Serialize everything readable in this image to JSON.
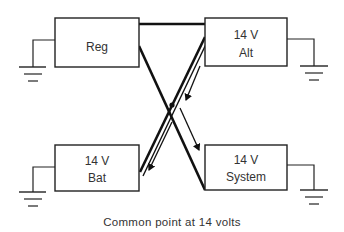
{
  "diagram": {
    "boxes": {
      "reg": {
        "line1": "Reg",
        "line2": ""
      },
      "alt": {
        "line1": "14 V",
        "line2": "Alt"
      },
      "bat": {
        "line1": "14 V",
        "line2": "Bat"
      },
      "system": {
        "line1": "14 V",
        "line2": "System"
      }
    },
    "caption": "Common point at 14 volts",
    "connections": [
      {
        "from": "Reg",
        "to": "Alt"
      },
      {
        "from": "Reg",
        "to": "System"
      },
      {
        "from": "Alt",
        "to": "Bat"
      }
    ],
    "current_flow": [
      {
        "from": "Alt",
        "to": "Bat"
      },
      {
        "from": "Alt",
        "to": "System"
      }
    ],
    "grounds": [
      "Reg",
      "Alt",
      "Bat",
      "System"
    ]
  }
}
